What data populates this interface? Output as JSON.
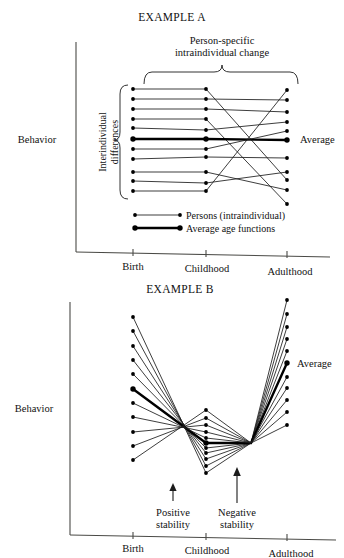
{
  "figure": {
    "behavior_label": "Behavior",
    "axis_ticks": [
      "Birth",
      "Childhood",
      "Adulthood"
    ]
  },
  "panel_a": {
    "title": "EXAMPLE A",
    "top_bracket_label_line1": "Person-specific",
    "top_bracket_label_line2": "intraindividual change",
    "side_bracket_label_line1": "Interindividual",
    "side_bracket_label_line2": "differences",
    "average_label": "Average",
    "legend": [
      {
        "label": "Persons (intraindividual)",
        "style": "thin"
      },
      {
        "label": "Average age functions",
        "style": "thick"
      }
    ],
    "y_label": "Behavior",
    "x_ticks": [
      "Birth",
      "Childhood",
      "Adulthood"
    ]
  },
  "panel_b": {
    "title": "EXAMPLE B",
    "average_label": "Average",
    "annotation_positive_line1": "Positive",
    "annotation_positive_line2": "stability",
    "annotation_negative_line1": "Negative",
    "annotation_negative_line2": "stability",
    "y_label": "Behavior",
    "x_ticks": [
      "Birth",
      "Childhood",
      "Adulthood"
    ]
  },
  "chart_data": [
    {
      "type": "line",
      "id": "example-a",
      "title": "EXAMPLE A",
      "xlabel": "",
      "ylabel": "Behavior",
      "x": [
        "Birth",
        "Childhood",
        "Adulthood"
      ],
      "x_px": [
        133,
        206,
        287
      ],
      "ylim_px": [
        205,
        88
      ],
      "grid": false,
      "legend_position": "inside-bottom-left",
      "annotations": [
        "Person-specific intraindividual change",
        "Interindividual differences",
        "Average"
      ],
      "series": [
        {
          "name": "person-1",
          "style": "thin",
          "values_px": [
            89,
            89,
            180
          ]
        },
        {
          "name": "person-2",
          "style": "thin",
          "values_px": [
            99,
            99,
            100
          ]
        },
        {
          "name": "person-3",
          "style": "thin",
          "values_px": [
            109,
            109,
            112
          ]
        },
        {
          "name": "person-4",
          "style": "thin",
          "values_px": [
            119,
            119,
            204
          ]
        },
        {
          "name": "person-5",
          "style": "thin",
          "values_px": [
            128,
            130,
            122
          ]
        },
        {
          "name": "average",
          "style": "thick",
          "values_px": [
            139,
            139,
            140
          ]
        },
        {
          "name": "person-6",
          "style": "thin",
          "values_px": [
            149,
            149,
            131
          ]
        },
        {
          "name": "person-7",
          "style": "thin",
          "values_px": [
            159,
            157,
            158
          ]
        },
        {
          "name": "person-8",
          "style": "thin",
          "values_px": [
            172,
            172,
            190
          ]
        },
        {
          "name": "person-9",
          "style": "thin",
          "values_px": [
            181,
            183,
            172
          ]
        },
        {
          "name": "person-10",
          "style": "thin",
          "values_px": [
            191,
            191,
            90
          ]
        }
      ]
    },
    {
      "type": "line",
      "id": "example-b",
      "title": "EXAMPLE B",
      "xlabel": "",
      "ylabel": "Behavior",
      "x": [
        "Birth",
        "Childhood",
        "Adulthood"
      ],
      "x_px": [
        133,
        206,
        287
      ],
      "ylim_px": [
        478,
        300
      ],
      "grid": false,
      "legend_position": "none",
      "annotations": [
        "Positive stability",
        "Negative stability",
        "Average"
      ],
      "series": [
        {
          "name": "person-1",
          "style": "thin",
          "values_px": [
            317,
            473,
            300
          ]
        },
        {
          "name": "person-2",
          "style": "thin",
          "values_px": [
            331,
            466,
            314
          ]
        },
        {
          "name": "person-3",
          "style": "thin",
          "values_px": [
            346,
            459,
            327
          ]
        },
        {
          "name": "person-4",
          "style": "thin",
          "values_px": [
            360,
            453,
            339
          ]
        },
        {
          "name": "person-5",
          "style": "thin",
          "values_px": [
            374,
            448,
            351
          ]
        },
        {
          "name": "average",
          "style": "thick",
          "values_px": [
            389,
            443,
            363
          ]
        },
        {
          "name": "person-6",
          "style": "thin",
          "values_px": [
            403,
            438,
            377
          ]
        },
        {
          "name": "person-7",
          "style": "thin",
          "values_px": [
            417,
            432,
            388
          ]
        },
        {
          "name": "person-8",
          "style": "thin",
          "values_px": [
            432,
            425,
            400
          ]
        },
        {
          "name": "person-9",
          "style": "thin",
          "values_px": [
            446,
            418,
            412
          ]
        },
        {
          "name": "person-10",
          "style": "thin",
          "values_px": [
            460,
            410,
            425
          ]
        }
      ],
      "convergence_point_px": [
        251,
        443
      ]
    }
  ]
}
